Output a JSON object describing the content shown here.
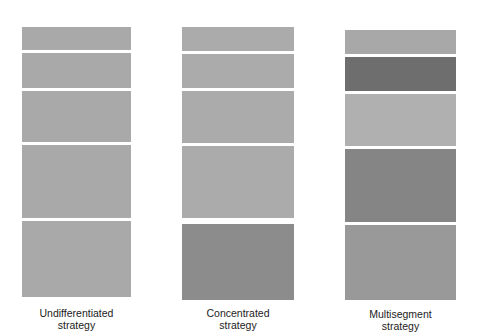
{
  "columns": [
    {
      "label_line1": "Undifferentiated",
      "label_line2": "strategy",
      "x": 22,
      "width": 109,
      "segments": [
        {
          "top": 27,
          "height": 23,
          "color": "#a9a9a9"
        },
        {
          "top": 53,
          "height": 35,
          "color": "#a9a9a9"
        },
        {
          "top": 91,
          "height": 51,
          "color": "#a9a9a9"
        },
        {
          "top": 145,
          "height": 73,
          "color": "#a9a9a9"
        },
        {
          "top": 221,
          "height": 76,
          "color": "#a9a9a9"
        }
      ]
    },
    {
      "label_line1": "Concentrated",
      "label_line2": "strategy",
      "x": 182,
      "width": 112,
      "segments": [
        {
          "top": 27,
          "height": 24,
          "color": "#ababab"
        },
        {
          "top": 54,
          "height": 34,
          "color": "#ababab"
        },
        {
          "top": 91,
          "height": 52,
          "color": "#ababab"
        },
        {
          "top": 146,
          "height": 72,
          "color": "#ababab"
        },
        {
          "top": 224,
          "height": 76,
          "color": "#8c8c8c"
        }
      ]
    },
    {
      "label_line1": "Multisegment",
      "label_line2": "strategy",
      "x": 345,
      "width": 111,
      "segments": [
        {
          "top": 30,
          "height": 24,
          "color": "#a8a8a8"
        },
        {
          "top": 57,
          "height": 34,
          "color": "#6e6e6e"
        },
        {
          "top": 94,
          "height": 52,
          "color": "#b0b0b0"
        },
        {
          "top": 149,
          "height": 73,
          "color": "#858585"
        },
        {
          "top": 225,
          "height": 75,
          "color": "#999999"
        }
      ]
    }
  ]
}
